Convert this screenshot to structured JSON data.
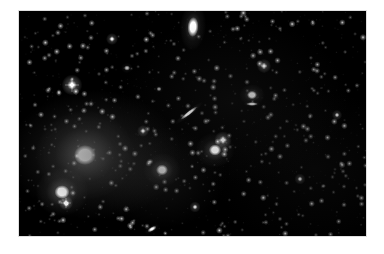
{
  "image": {
    "kind": "astronomical-sky-photograph",
    "subject": "galaxy cluster star field",
    "background_color": "#ffffff",
    "sky_color": "#000000",
    "star_color": "#ffffff",
    "frame": {
      "x": 19,
      "y": 11,
      "width": 347,
      "height": 225
    }
  },
  "sky": {
    "galaxies": [
      {
        "name": "elongated-elliptical-top",
        "cx": 174,
        "cy": 16,
        "rx": 5.5,
        "ry": 10.0,
        "angle": 4,
        "brightness": 1.0,
        "halo": 2.4,
        "type": "elliptical"
      },
      {
        "name": "edge-on-spiral-streak",
        "cx": 170,
        "cy": 102,
        "rx": 10.5,
        "ry": 2.0,
        "angle": -38,
        "brightness": 0.92,
        "halo": 1.7,
        "type": "edge-on-spiral"
      },
      {
        "name": "lenticular-core-right",
        "cx": 233,
        "cy": 84,
        "rx": 5.0,
        "ry": 4.2,
        "angle": 0,
        "brightness": 1.0,
        "halo": 2.6,
        "type": "lenticular"
      },
      {
        "name": "lenticular-bar-right",
        "cx": 233,
        "cy": 93,
        "rx": 6.0,
        "ry": 1.9,
        "angle": 0,
        "brightness": 0.82,
        "halo": 1.5,
        "type": "lenticular-bar"
      },
      {
        "name": "giant-elliptical-primary",
        "cx": 66,
        "cy": 144,
        "rx": 11.0,
        "ry": 10.0,
        "angle": 0,
        "brightness": 1.0,
        "halo": 4.6,
        "type": "giant-elliptical"
      },
      {
        "name": "bright-elliptical-lower-left",
        "cx": 43,
        "cy": 181,
        "rx": 7.5,
        "ry": 6.8,
        "angle": 0,
        "brightness": 1.0,
        "halo": 3.6,
        "type": "elliptical"
      },
      {
        "name": "elliptical-center-lower",
        "cx": 143,
        "cy": 159,
        "rx": 6.0,
        "ry": 5.4,
        "angle": 0,
        "brightness": 0.97,
        "halo": 3.2,
        "type": "elliptical"
      },
      {
        "name": "elliptical-right-mid",
        "cx": 196,
        "cy": 139,
        "rx": 6.2,
        "ry": 5.6,
        "angle": 0,
        "brightness": 0.97,
        "halo": 3.2,
        "type": "elliptical"
      },
      {
        "name": "small-streak-bottom",
        "cx": 133,
        "cy": 218,
        "rx": 5.0,
        "ry": 2.2,
        "angle": -30,
        "brightness": 0.8,
        "halo": 1.6,
        "type": "edge-on-spiral"
      },
      {
        "name": "faint-elliptical-upper-left",
        "cx": 108,
        "cy": 57,
        "rx": 3.0,
        "ry": 2.6,
        "angle": 0,
        "brightness": 0.55,
        "halo": 2.0,
        "type": "elliptical"
      },
      {
        "name": "faint-elliptical-upper-mid",
        "cx": 140,
        "cy": 78,
        "rx": 2.6,
        "ry": 2.2,
        "angle": 0,
        "brightness": 0.48,
        "halo": 1.8,
        "type": "elliptical"
      }
    ],
    "bright_stars": [
      {
        "name": "spiked-star-left",
        "cx": 53,
        "cy": 74,
        "r": 2.6,
        "brightness": 1.0,
        "spikes": 7.0
      },
      {
        "name": "spiked-star-lower-left",
        "cx": 47,
        "cy": 192,
        "r": 1.8,
        "brightness": 0.95,
        "spikes": 5.0
      },
      {
        "name": "star-right-of-lenticular",
        "cx": 204,
        "cy": 129,
        "r": 2.2,
        "brightness": 0.92,
        "spikes": 3.5
      },
      {
        "name": "star-upper-right",
        "cx": 245,
        "cy": 55,
        "r": 1.8,
        "brightness": 0.85,
        "spikes": 3.0
      },
      {
        "name": "star-center",
        "cx": 124,
        "cy": 120,
        "r": 1.5,
        "brightness": 0.8,
        "spikes": 2.6
      },
      {
        "name": "star-top-mid",
        "cx": 93,
        "cy": 28,
        "r": 1.5,
        "brightness": 0.78,
        "spikes": 2.4
      },
      {
        "name": "star-lower-right",
        "cx": 281,
        "cy": 168,
        "r": 1.4,
        "brightness": 0.75,
        "spikes": 2.2
      },
      {
        "name": "star-bottom-mid",
        "cx": 176,
        "cy": 196,
        "r": 1.4,
        "brightness": 0.74,
        "spikes": 2.2
      },
      {
        "name": "star-right-edge",
        "cx": 318,
        "cy": 104,
        "r": 1.3,
        "brightness": 0.7,
        "spikes": 2.0
      }
    ],
    "field_star_count": 900,
    "seed": 20240517
  }
}
